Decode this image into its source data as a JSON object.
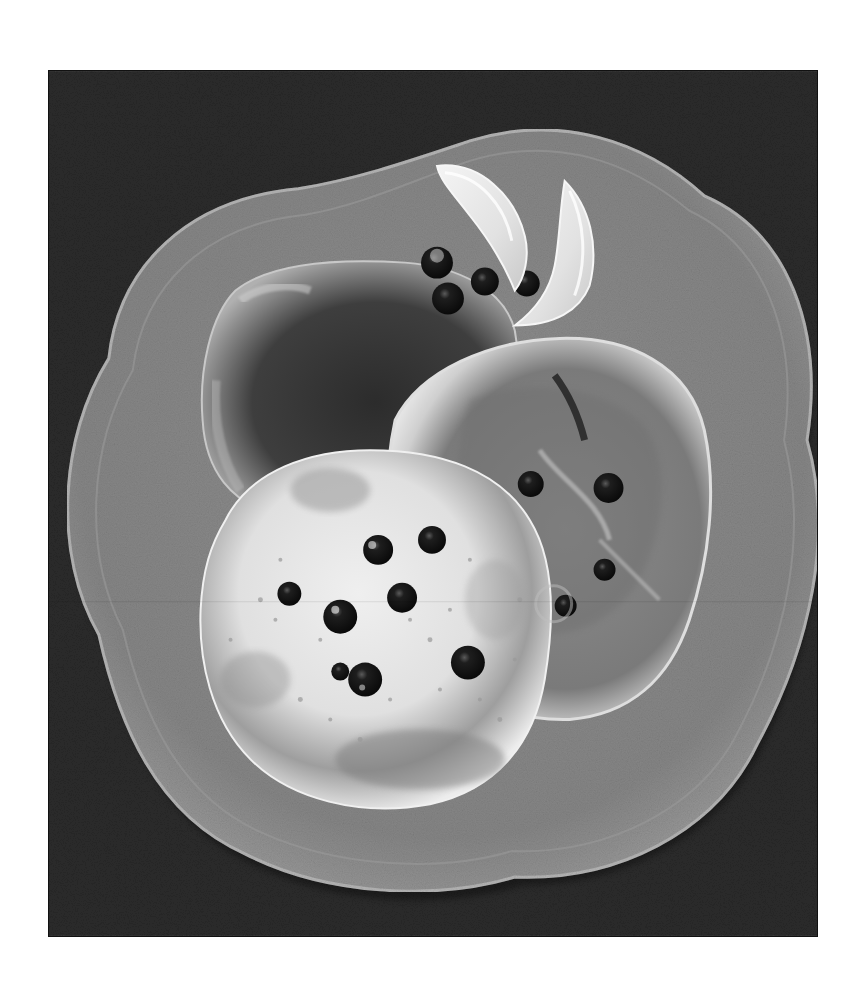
{
  "image": {
    "alt": "Black-and-white photo of three blueberry pancakes on a scalloped flower-shaped plate, garnished with two lemon wedges and blueberries, on a dark textured tablecloth",
    "palette": {
      "page_background": "#ffffff",
      "tablecloth": "#2e2e2e",
      "plate": "#8a8a8a",
      "plate_rim_highlight": "#a9a9a9",
      "pancake_light": "#e6e6e6",
      "pancake_mid": "#9a9a9a",
      "pancake_dark": "#3c3c3c",
      "blueberry": "#141414",
      "lemon": "#ececec"
    },
    "objects": {
      "plate": "flower-shaped plate",
      "pancakes": [
        "dark pancake (back)",
        "pancake with blueberries (right)",
        "light pancake with blueberries (front)"
      ],
      "garnish": [
        "lemon wedge",
        "lemon wedge",
        "blueberries"
      ]
    }
  }
}
